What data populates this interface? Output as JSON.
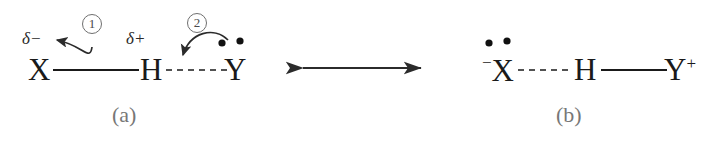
{
  "figure": {
    "background_color": "#ffffff",
    "ink_color": "#1a1a1a",
    "annotation_color": "#4a4a4a",
    "caption_color": "#777777"
  },
  "structure_a": {
    "caption": "(a)",
    "donor_atom": "X",
    "hydrogen_atom": "H",
    "acceptor_atom": "Y",
    "partial_negative_label": "δ−",
    "partial_positive_label": "δ+",
    "covalent_bond": "X—H solid bond",
    "hydrogen_bond": "H···Y dashed bond",
    "lone_pair_count": 2,
    "steps": [
      {
        "number": "1",
        "description": "electron pair shifts from X—H bond toward X"
      },
      {
        "number": "2",
        "description": "lone pair on Y attacks H"
      }
    ]
  },
  "resonance_arrow": {
    "symbol": "↔",
    "name": "double-headed resonance arrow"
  },
  "structure_b": {
    "caption": "(b)",
    "donor_atom": "X",
    "donor_charge": "−",
    "hydrogen_atom": "H",
    "acceptor_atom": "Y",
    "acceptor_charge": "+",
    "hydrogen_bond": "X···H dashed bond",
    "covalent_bond": "H—Y solid bond",
    "lone_pair_count": 2
  }
}
